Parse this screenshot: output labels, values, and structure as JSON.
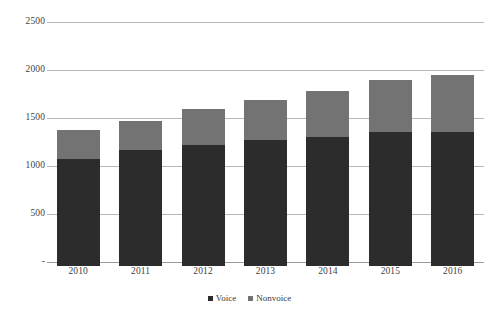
{
  "chart_data": {
    "type": "bar",
    "subtype": "stacked-column",
    "title": "",
    "xlabel": "",
    "ylabel": "",
    "categories": [
      "2010",
      "2011",
      "2012",
      "2013",
      "2014",
      "2015",
      "2016"
    ],
    "series": [
      {
        "name": "Voice",
        "color": "#2c2c2c",
        "values": [
          1115,
          1208,
          1260,
          1312,
          1344,
          1396,
          1396
        ]
      },
      {
        "name": "Nonvoice",
        "color": "#737373",
        "values": [
          302,
          302,
          375,
          417,
          479,
          542,
          594
        ]
      }
    ],
    "totals": [
      1417,
      1510,
      1635,
      1729,
      1823,
      1938,
      1990
    ],
    "ylim": [
      0,
      2500
    ],
    "y_ticks": [
      0,
      500,
      1000,
      1500,
      2000,
      2500
    ],
    "y_tick_labels": [
      "-",
      "500",
      "1000",
      "1500",
      "2000",
      "2500"
    ],
    "grid": true,
    "legend_position": "bottom"
  },
  "legend": {
    "items": [
      {
        "label": "Voice",
        "color": "#2c2c2c"
      },
      {
        "label": "Nonvoice",
        "color": "#737373"
      }
    ]
  },
  "colors": {
    "voice": "#2c2c2c",
    "nonvoice": "#737373",
    "gridline": "#b7b7b7",
    "baseline": "#9a9a9a",
    "text": "#3f3f3f",
    "background": "#ffffff"
  }
}
